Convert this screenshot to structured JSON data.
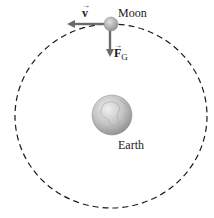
{
  "figure": {
    "bodies": {
      "moon": {
        "label": "Moon"
      },
      "earth": {
        "label": "Earth"
      }
    },
    "vectors": {
      "velocity": {
        "symbol": "v",
        "arrow_accent": "→",
        "direction": "left (tangent to orbit)"
      },
      "gravity": {
        "symbol": "F",
        "subscript": "G",
        "arrow_accent": "→",
        "direction": "down (toward Earth)"
      }
    },
    "orbit": {
      "style": "dashed",
      "shape": "ellipse"
    },
    "colors": {
      "orbit": "#1a1a1a",
      "vector": "#6b6b6b",
      "moon": "#a8a8a8",
      "earth": "#bdbdbd",
      "text": "#1a1a1a"
    }
  }
}
